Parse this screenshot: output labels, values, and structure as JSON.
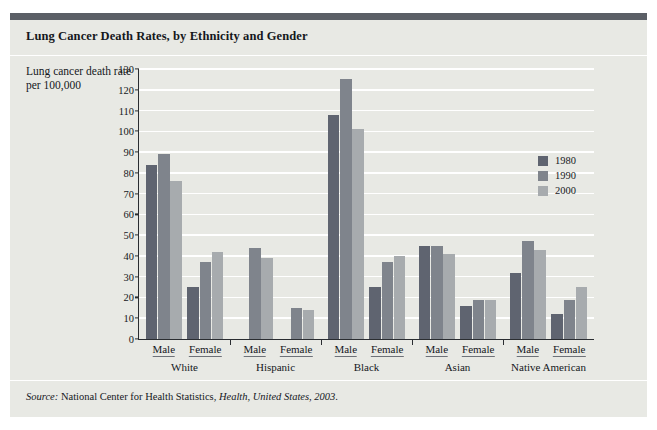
{
  "title": "Lung Cancer Death Rates, by Ethnicity and Gender",
  "axis_caption": "Lung cancer death rate per 100,000",
  "source_prefix": "Source:",
  "source_text": " National Center for Health Statistics, ",
  "source_italic": "Health, United States, 2003",
  "source_end": ".",
  "colors": {
    "figure_background": "#e8e9e4",
    "top_rule": "#5b5f66",
    "axis": "#2a2d31",
    "gridline": "#ffffff",
    "series_1980": "#5f6470",
    "series_1990": "#7f848c",
    "series_2000": "#a7abae",
    "text": "#15181c"
  },
  "chart_data": {
    "type": "bar",
    "title": "Lung Cancer Death Rates, by Ethnicity and Gender",
    "xlabel": "",
    "ylabel": "Lung cancer death rate per 100,000",
    "ylim": [
      0,
      130
    ],
    "ytick_labels": [
      "0",
      "10",
      "20",
      "30",
      "40",
      "50",
      "60",
      "70",
      "80",
      "90",
      "100",
      "110",
      "120",
      "130"
    ],
    "yticks": [
      0,
      10,
      20,
      30,
      40,
      50,
      60,
      70,
      80,
      90,
      100,
      110,
      120,
      130
    ],
    "grid": true,
    "legend_position": "right",
    "categories": [
      "White Male",
      "White Female",
      "Hispanic Male",
      "Hispanic Female",
      "Black Male",
      "Black Female",
      "Asian Male",
      "Asian Female",
      "Native American Male",
      "Native American Female"
    ],
    "ethnicities": [
      "White",
      "Hispanic",
      "Black",
      "Asian",
      "Native American"
    ],
    "genders": [
      "Male",
      "Female"
    ],
    "series": [
      {
        "name": "1980",
        "color": "#5f6470",
        "values": [
          84,
          25,
          null,
          null,
          108,
          25,
          45,
          16,
          32,
          12
        ]
      },
      {
        "name": "1990",
        "color": "#7f848c",
        "values": [
          89,
          37,
          44,
          15,
          125,
          37,
          45,
          19,
          47,
          19
        ]
      },
      {
        "name": "2000",
        "color": "#a7abae",
        "values": [
          76,
          42,
          39,
          14,
          101,
          40,
          41,
          19,
          43,
          25
        ]
      }
    ],
    "groups": [
      {
        "ethnicity": "White",
        "bars": [
          {
            "gender": "Male",
            "values": {
              "1980": 84,
              "1990": 89,
              "2000": 76
            }
          },
          {
            "gender": "Female",
            "values": {
              "1980": 25,
              "1990": 37,
              "2000": 42
            }
          }
        ]
      },
      {
        "ethnicity": "Hispanic",
        "bars": [
          {
            "gender": "Male",
            "values": {
              "1980": null,
              "1990": 44,
              "2000": 39
            }
          },
          {
            "gender": "Female",
            "values": {
              "1980": null,
              "1990": 15,
              "2000": 14
            }
          }
        ]
      },
      {
        "ethnicity": "Black",
        "bars": [
          {
            "gender": "Male",
            "values": {
              "1980": 108,
              "1990": 125,
              "2000": 101
            }
          },
          {
            "gender": "Female",
            "values": {
              "1980": 25,
              "1990": 37,
              "2000": 40
            }
          }
        ]
      },
      {
        "ethnicity": "Asian",
        "bars": [
          {
            "gender": "Male",
            "values": {
              "1980": 45,
              "1990": 45,
              "2000": 41
            }
          },
          {
            "gender": "Female",
            "values": {
              "1980": 16,
              "1990": 19,
              "2000": 19
            }
          }
        ]
      },
      {
        "ethnicity": "Native American",
        "bars": [
          {
            "gender": "Male",
            "values": {
              "1980": 32,
              "1990": 47,
              "2000": 43
            }
          },
          {
            "gender": "Female",
            "values": {
              "1980": 12,
              "1990": 19,
              "2000": 25
            }
          }
        ]
      }
    ],
    "legend": [
      "1980",
      "1990",
      "2000"
    ]
  }
}
